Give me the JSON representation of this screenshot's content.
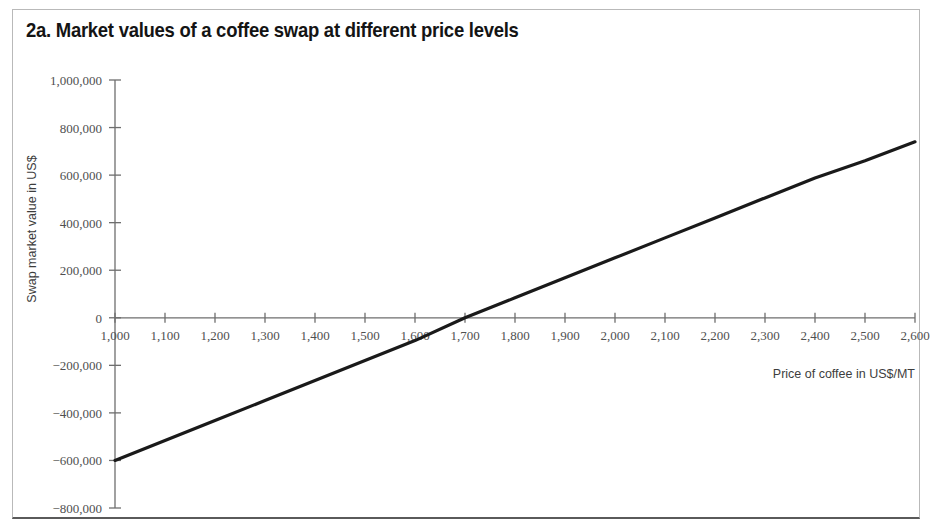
{
  "figure": {
    "title": "2a. Market values of a coffee swap at different price levels",
    "border_color": "#b9b9b9",
    "line_color": "#1a1a1a",
    "axis_color": "#6e6e6e",
    "text_color": "#4f4f4f"
  },
  "chart_data": {
    "type": "line",
    "title": "2a. Market values of a coffee swap at different price levels",
    "xlabel": "Price of coffee in US$/MT",
    "ylabel": "Swap market value in US$",
    "xlim": [
      1000,
      2600
    ],
    "ylim": [
      -800000,
      1000000
    ],
    "grid": false,
    "legend": false,
    "x_ticks": [
      1000,
      1100,
      1200,
      1300,
      1400,
      1500,
      1600,
      1700,
      1800,
      1900,
      2000,
      2100,
      2200,
      2300,
      2400,
      2500,
      2600
    ],
    "x_tick_labels": [
      "1,000",
      "1,100",
      "1,200",
      "1,300",
      "1,400",
      "1,500",
      "1,600",
      "1,700",
      "1,800",
      "1,900",
      "2,000",
      "2,100",
      "2,200",
      "2,300",
      "2,400",
      "2,500",
      "2,600"
    ],
    "y_ticks": [
      1000000,
      800000,
      600000,
      400000,
      200000,
      0,
      -200000,
      -400000,
      -600000,
      -800000
    ],
    "y_tick_labels": [
      "1,000,000",
      "800,000",
      "600,000",
      "400,000",
      "200,000",
      "0",
      "−200,000",
      "−400,000",
      "−600,000",
      "−800,000"
    ],
    "series": [
      {
        "name": "Swap market value",
        "color": "#1a1a1a",
        "x": [
          1000,
          1100,
          1200,
          1300,
          1400,
          1500,
          1600,
          1700,
          1800,
          1900,
          2000,
          2100,
          2200,
          2300,
          2400,
          2500,
          2600
        ],
        "values": [
          -600000,
          -516000,
          -432000,
          -348000,
          -264000,
          -180000,
          -96000,
          0,
          84000,
          168000,
          252000,
          336000,
          420000,
          504000,
          588000,
          660000,
          740000
        ]
      }
    ],
    "zero_crossing_x": 1700
  }
}
